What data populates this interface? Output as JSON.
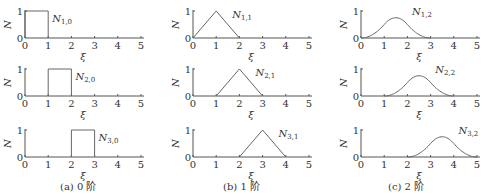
{
  "chart_data": [
    {
      "type": "line",
      "panel": "a",
      "order": 0,
      "title": "N1,0",
      "label_main": "N",
      "label_sub": "1,0",
      "xlabel": "ξ",
      "ylabel": "N",
      "xlim": [
        0,
        5
      ],
      "ylim": [
        0,
        1
      ],
      "xticks": [
        "0",
        "1",
        "2",
        "3",
        "4",
        "5"
      ],
      "yticks": [
        "0",
        "1"
      ],
      "x": [
        0,
        0,
        1,
        1
      ],
      "y": [
        0,
        1,
        1,
        0
      ]
    },
    {
      "type": "line",
      "panel": "a",
      "order": 0,
      "title": "N2,0",
      "label_main": "N",
      "label_sub": "2,0",
      "xlabel": "ξ",
      "ylabel": "N",
      "xlim": [
        0,
        5
      ],
      "ylim": [
        0,
        1
      ],
      "xticks": [
        "0",
        "1",
        "2",
        "3",
        "4",
        "5"
      ],
      "yticks": [
        "0",
        "1"
      ],
      "x": [
        1,
        1,
        2,
        2
      ],
      "y": [
        0,
        1,
        1,
        0
      ]
    },
    {
      "type": "line",
      "panel": "a",
      "order": 0,
      "title": "N3,0",
      "label_main": "N",
      "label_sub": "3,0",
      "xlabel": "ξ",
      "ylabel": "N",
      "xlim": [
        0,
        5
      ],
      "ylim": [
        0,
        1
      ],
      "xticks": [
        "0",
        "1",
        "2",
        "3",
        "4",
        "5"
      ],
      "yticks": [
        "0",
        "1"
      ],
      "x": [
        2,
        2,
        3,
        3
      ],
      "y": [
        0,
        1,
        1,
        0
      ]
    },
    {
      "type": "line",
      "panel": "b",
      "order": 1,
      "title": "N1,1",
      "label_main": "N",
      "label_sub": "1,1",
      "xlabel": "ξ",
      "ylabel": "N",
      "xlim": [
        0,
        5
      ],
      "ylim": [
        0,
        1
      ],
      "xticks": [
        "0",
        "1",
        "2",
        "3",
        "4",
        "5"
      ],
      "yticks": [
        "0",
        "1"
      ],
      "x": [
        0,
        1,
        2
      ],
      "y": [
        0,
        1,
        0
      ]
    },
    {
      "type": "line",
      "panel": "b",
      "order": 1,
      "title": "N2,1",
      "label_main": "N",
      "label_sub": "2,1",
      "xlabel": "ξ",
      "ylabel": "N",
      "xlim": [
        0,
        5
      ],
      "ylim": [
        0,
        1
      ],
      "xticks": [
        "0",
        "1",
        "2",
        "3",
        "4",
        "5"
      ],
      "yticks": [
        "0",
        "1"
      ],
      "x": [
        1,
        2,
        3
      ],
      "y": [
        0,
        1,
        0
      ]
    },
    {
      "type": "line",
      "panel": "b",
      "order": 1,
      "title": "N3,1",
      "label_main": "N",
      "label_sub": "3,1",
      "xlabel": "ξ",
      "ylabel": "N",
      "xlim": [
        0,
        5
      ],
      "ylim": [
        0,
        1
      ],
      "xticks": [
        "0",
        "1",
        "2",
        "3",
        "4",
        "5"
      ],
      "yticks": [
        "0",
        "1"
      ],
      "x": [
        2,
        3,
        4
      ],
      "y": [
        0,
        1,
        0
      ]
    },
    {
      "type": "line",
      "panel": "c",
      "order": 2,
      "title": "N1,2",
      "label_main": "N",
      "label_sub": "1,2",
      "xlabel": "ξ",
      "ylabel": "N",
      "xlim": [
        0,
        5
      ],
      "ylim": [
        0,
        1
      ],
      "xticks": [
        "0",
        "1",
        "2",
        "3",
        "4",
        "5"
      ],
      "yticks": [
        "0",
        "1"
      ],
      "x": [
        0,
        0.5,
        1,
        1.5,
        2,
        2.5,
        3
      ],
      "y": [
        0,
        0.125,
        0.5,
        0.75,
        0.5,
        0.125,
        0
      ]
    },
    {
      "type": "line",
      "panel": "c",
      "order": 2,
      "title": "N2,2",
      "label_main": "N",
      "label_sub": "2,2",
      "xlabel": "ξ",
      "ylabel": "N",
      "xlim": [
        0,
        5
      ],
      "ylim": [
        0,
        1
      ],
      "xticks": [
        "0",
        "1",
        "2",
        "3",
        "4",
        "5"
      ],
      "yticks": [
        "0",
        "1"
      ],
      "x": [
        1,
        1.5,
        2,
        2.5,
        3,
        3.5,
        4
      ],
      "y": [
        0,
        0.125,
        0.5,
        0.75,
        0.5,
        0.125,
        0
      ]
    },
    {
      "type": "line",
      "panel": "c",
      "order": 2,
      "title": "N3,2",
      "label_main": "N",
      "label_sub": "3,2",
      "xlabel": "ξ",
      "ylabel": "N",
      "xlim": [
        0,
        5
      ],
      "ylim": [
        0,
        1
      ],
      "xticks": [
        "0",
        "1",
        "2",
        "3",
        "4",
        "5"
      ],
      "yticks": [
        "0",
        "1"
      ],
      "x": [
        2,
        2.5,
        3,
        3.5,
        4,
        4.5,
        5
      ],
      "y": [
        0,
        0.125,
        0.5,
        0.75,
        0.5,
        0.125,
        0
      ]
    }
  ],
  "captions": {
    "a": "(a) 0 阶",
    "b": "(b) 1 阶",
    "c": "(c) 2 阶"
  },
  "colors": {
    "axis": "#555555",
    "curve": "#666666",
    "text": "#333333"
  }
}
